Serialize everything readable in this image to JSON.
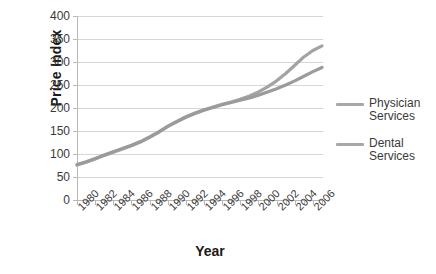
{
  "chart_data": {
    "type": "line",
    "title": "",
    "xlabel": "Year",
    "ylabel": "Price Index",
    "xlim": [
      1980,
      2007
    ],
    "ylim": [
      0,
      400
    ],
    "yticks": [
      0,
      50,
      100,
      150,
      200,
      250,
      300,
      350,
      400
    ],
    "xticklabels": [
      "1980",
      "1982",
      "1984",
      "1986",
      "1988",
      "1990",
      "1992",
      "1994",
      "1996",
      "1998",
      "2000",
      "2002",
      "2004",
      "2006"
    ],
    "xtick_step_years": 1,
    "xlabel_step_years": 2,
    "grid": "horizontal",
    "legend_position": "right",
    "x": [
      1980,
      1981,
      1982,
      1983,
      1984,
      1985,
      1986,
      1987,
      1988,
      1989,
      1990,
      1991,
      1992,
      1993,
      1994,
      1995,
      1996,
      1997,
      1998,
      1999,
      2000,
      2001,
      2002,
      2003,
      2004,
      2005,
      2006,
      2007
    ],
    "series": [
      {
        "name": "Physician Services",
        "color": "#a3a3a3",
        "values": [
          76,
          82,
          89,
          97,
          104,
          111,
          118,
          126,
          136,
          147,
          160,
          171,
          181,
          189,
          196,
          202,
          208,
          213,
          219,
          226,
          235,
          246,
          259,
          275,
          293,
          311,
          325,
          335
        ]
      },
      {
        "name": "Dental Services",
        "color": "#9b9b9b",
        "values": [
          77,
          83,
          90,
          98,
          105,
          112,
          119,
          127,
          137,
          148,
          160,
          170,
          180,
          188,
          195,
          201,
          207,
          212,
          217,
          222,
          228,
          235,
          242,
          250,
          259,
          269,
          279,
          288
        ]
      }
    ]
  },
  "legend": {
    "items": [
      {
        "label_line1": "Physician",
        "label_line2": "Services",
        "color": "#a8a8a8"
      },
      {
        "label_line1": "Dental",
        "label_line2": "Services",
        "color": "#a8a8a8"
      }
    ]
  },
  "axes": {
    "y_title": "Price Index",
    "x_title": "Year"
  }
}
